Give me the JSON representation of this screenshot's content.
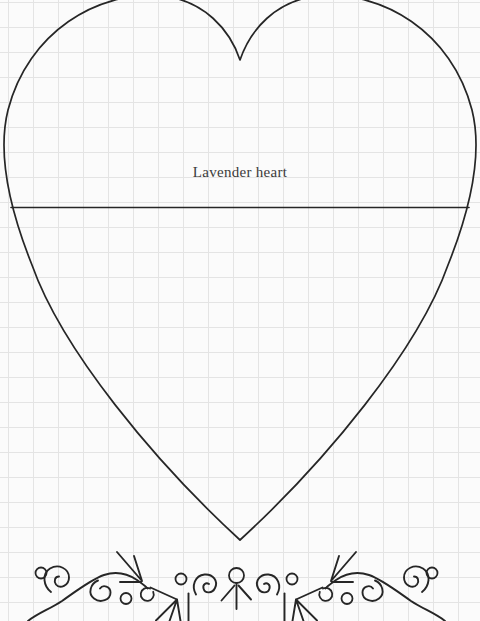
{
  "pattern": {
    "label": "Lavender heart"
  },
  "colors": {
    "page_bg": "#fbfbfb",
    "grid_line": "#e4e4e4",
    "ink": "#262626",
    "text": "#3a3a3a"
  }
}
